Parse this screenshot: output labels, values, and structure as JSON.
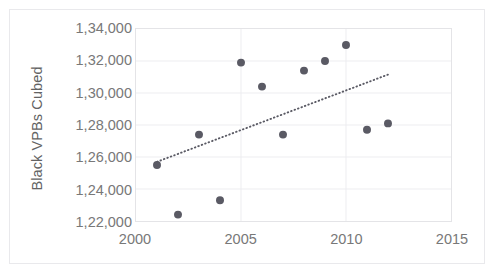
{
  "chart_data": {
    "type": "scatter",
    "title": "",
    "subtitle": "",
    "xlabel": "",
    "ylabel": "Black VPBs Cubed",
    "xlim": [
      2000,
      2015
    ],
    "ylim": [
      122000,
      134000
    ],
    "xticks": [
      "2000",
      "2005",
      "2010",
      "2015"
    ],
    "xtick_values": [
      2000,
      2005,
      2010,
      2015
    ],
    "yticks": [
      "1,22,000",
      "1,24,000",
      "1,26,000",
      "1,28,000",
      "1,30,000",
      "1,32,000",
      "1,34,000"
    ],
    "ytick_values": [
      122000,
      124000,
      126000,
      128000,
      130000,
      132000,
      134000
    ],
    "grid": "horizontal-and-vertical-major",
    "legend": "none",
    "number_format": "indian-grouping",
    "marker": {
      "shape": "circle",
      "color": "#5a5a64",
      "size_px": 8
    },
    "series": [
      {
        "name": "Black VPBs Cubed",
        "x": [
          2001,
          2002,
          2003,
          2004,
          2005,
          2006,
          2007,
          2008,
          2009,
          2010,
          2011,
          2012
        ],
        "y": [
          125500,
          122400,
          127400,
          123300,
          131900,
          130400,
          127400,
          131400,
          132000,
          133000,
          127700,
          128100
        ]
      }
    ],
    "trendline": {
      "type": "linear",
      "style": "dotted",
      "color": "#5a5a64",
      "x_start": 2001,
      "x_end": 2012.1,
      "y_start": 125700,
      "y_end": 131200
    }
  },
  "colors": {
    "marker": "#5a5a64",
    "trendline": "#5a5a64",
    "gridline": "#ededf0",
    "axis_frame": "#e4e4e7",
    "outer_border": "#e9e9ec",
    "tick_label": "#787878",
    "axis_title": "#636363",
    "background": "#ffffff"
  }
}
